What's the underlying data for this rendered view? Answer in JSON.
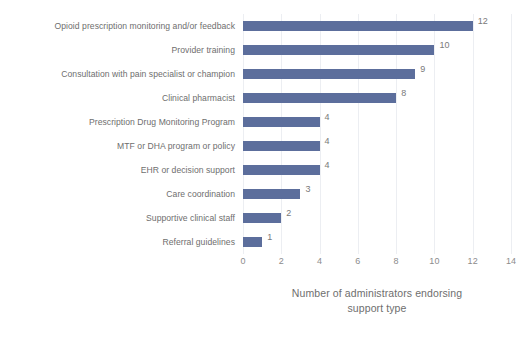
{
  "chart": {
    "axis_title_line1": "Number of administrators endorsing",
    "axis_title_line2": "support type"
  },
  "chart_data": {
    "type": "bar",
    "orientation": "horizontal",
    "title": "",
    "subtitle": "",
    "xlabel": "Number of administrators endorsing support type",
    "ylabel": "",
    "xlim": [
      0,
      14
    ],
    "grid": true,
    "legend": null,
    "bar_color": "#5c6e9c",
    "label_color": "#6e6e6e",
    "tick_color": "#8c8c8c",
    "xticks": [
      0,
      2,
      4,
      6,
      8,
      10,
      12,
      14
    ],
    "xtick_labels": [
      "0",
      "2",
      "4",
      "6",
      "8",
      "10",
      "12",
      "14"
    ],
    "categories": [
      "Opioid prescription monitoring and/or feedback",
      "Provider training",
      "Consultation with pain specialist or champion",
      "Clinical pharmacist",
      "Prescription Drug Monitoring Program",
      "MTF or DHA program or policy",
      "EHR or decision support",
      "Care coordination",
      "Supportive clinical staff",
      "Referral guidelines"
    ],
    "values": [
      12,
      10,
      9,
      8,
      4,
      4,
      4,
      3,
      2,
      1
    ],
    "value_labels": [
      "12",
      "10",
      "9",
      "8",
      "4",
      "4",
      "4",
      "3",
      "2",
      "1"
    ]
  }
}
